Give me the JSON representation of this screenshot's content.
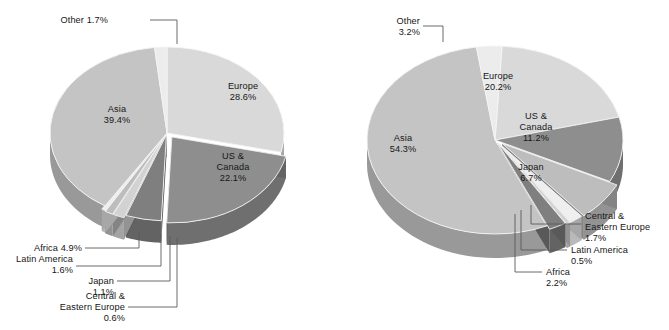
{
  "figure": {
    "background": "#ffffff",
    "text_color": "#161616",
    "leader_color": "#5a5a5a"
  },
  "palette": {
    "europe": "#d9d9d9",
    "us_canada": "#8e8e8e",
    "japan": "#bdbdbd",
    "central_eastern_europe": "#efefef",
    "latin_america": "#d2d2d2",
    "africa": "#7f7f7f",
    "asia": "#c4c4c4",
    "other": "#ececec",
    "side_dark": "#9a9a9a",
    "side_darker": "#6f6f6f",
    "side_light": "#b5b5b5"
  },
  "chart_data": [
    {
      "type": "pie",
      "title": "",
      "id": "left-pie",
      "legend": "none",
      "labels": [
        "Europe",
        "US & Canada",
        "Africa",
        "Latin America",
        "Japan",
        "Central & Eastern Europe",
        "Asia",
        "Other"
      ],
      "values": [
        28.6,
        22.1,
        4.9,
        1.6,
        1.1,
        0.6,
        39.4,
        1.7
      ],
      "value_suffix": "%",
      "slices": [
        {
          "label": "Europe",
          "value": 28.6,
          "value_text": "28.6%",
          "placement": "inside",
          "color": "#d9d9d9"
        },
        {
          "label": "US & Canada",
          "value": 22.1,
          "value_text": "22.1%",
          "placement": "inside",
          "color": "#8e8e8e"
        },
        {
          "label": "Africa",
          "value": 4.9,
          "value_text": "4.9%",
          "placement": "callout",
          "color": "#7f7f7f"
        },
        {
          "label": "Latin America",
          "value": 1.6,
          "value_text": "1.6%",
          "placement": "callout",
          "color": "#d2d2d2"
        },
        {
          "label": "Japan",
          "value": 1.1,
          "value_text": "1.1%",
          "placement": "callout",
          "color": "#bdbdbd"
        },
        {
          "label": "Central & Eastern Europe",
          "value": 0.6,
          "value_text": "0.6%",
          "placement": "callout",
          "color": "#efefef"
        },
        {
          "label": "Asia",
          "value": 39.4,
          "value_text": "39.4%",
          "placement": "inside",
          "color": "#c4c4c4"
        },
        {
          "label": "Other",
          "value": 1.7,
          "value_text": "1.7%",
          "placement": "callout",
          "color": "#ececec"
        }
      ]
    },
    {
      "type": "pie",
      "title": "",
      "id": "right-pie",
      "legend": "none",
      "labels": [
        "Europe",
        "US & Canada",
        "Japan",
        "Central & Eastern Europe",
        "Latin America",
        "Africa",
        "Asia",
        "Other"
      ],
      "values": [
        20.2,
        11.2,
        6.7,
        1.7,
        0.5,
        2.2,
        54.3,
        3.2
      ],
      "value_suffix": "%",
      "slices": [
        {
          "label": "Europe",
          "value": 20.2,
          "value_text": "20.2%",
          "placement": "inside",
          "color": "#d9d9d9"
        },
        {
          "label": "US & Canada",
          "value": 11.2,
          "value_text": "11.2%",
          "placement": "inside",
          "color": "#8e8e8e"
        },
        {
          "label": "Japan",
          "value": 6.7,
          "value_text": "6.7%",
          "placement": "inside",
          "color": "#bdbdbd"
        },
        {
          "label": "Central & Eastern Europe",
          "value": 1.7,
          "value_text": "1.7%",
          "placement": "callout",
          "color": "#efefef"
        },
        {
          "label": "Latin America",
          "value": 0.5,
          "value_text": "0.5%",
          "placement": "callout",
          "color": "#d2d2d2"
        },
        {
          "label": "Africa",
          "value": 2.2,
          "value_text": "2.2%",
          "placement": "callout",
          "color": "#7f7f7f"
        },
        {
          "label": "Asia",
          "value": 54.3,
          "value_text": "54.3%",
          "placement": "inside",
          "color": "#c4c4c4"
        },
        {
          "label": "Other",
          "value": 3.2,
          "value_text": "3.2%",
          "placement": "callout",
          "color": "#ececec"
        }
      ]
    }
  ],
  "left_chart": {
    "inside_labels": [
      {
        "name": "europe",
        "line1": "Europe",
        "line2": "28.6%"
      },
      {
        "name": "asia",
        "line1": "Asia",
        "line2": "39.4%"
      },
      {
        "name": "us-canada",
        "line1": "US &",
        "line2": "Canada",
        "line3": "22.1%"
      }
    ],
    "callouts": [
      {
        "name": "other",
        "line1": "Other 1.7%"
      },
      {
        "name": "africa",
        "line1": "Africa 4.9%"
      },
      {
        "name": "latin-america",
        "line1": "Latin America",
        "line2": "1.6%"
      },
      {
        "name": "japan",
        "line1": "Japan",
        "line2": "1.1%"
      },
      {
        "name": "central-eastern-europe",
        "line1": "Central &",
        "line2": "Eastern Europe",
        "line3": "0.6%"
      }
    ]
  },
  "right_chart": {
    "inside_labels": [
      {
        "name": "europe",
        "line1": "Europe",
        "line2": "20.2%"
      },
      {
        "name": "asia",
        "line1": "Asia",
        "line2": "54.3%"
      },
      {
        "name": "us-canada",
        "line1": "US &",
        "line2": "Canada",
        "line3": "11.2%"
      },
      {
        "name": "japan",
        "line1": "Japan",
        "line2": "6.7%"
      }
    ],
    "callouts": [
      {
        "name": "other",
        "line1": "Other",
        "line2": "3.2%"
      },
      {
        "name": "central-eastern-europe",
        "line1": "Central &",
        "line2": "Eastern Europe",
        "line3": "1.7%"
      },
      {
        "name": "latin-america",
        "line1": "Latin America",
        "line2": "0.5%"
      },
      {
        "name": "africa",
        "line1": "Africa",
        "line2": "2.2%"
      }
    ]
  }
}
